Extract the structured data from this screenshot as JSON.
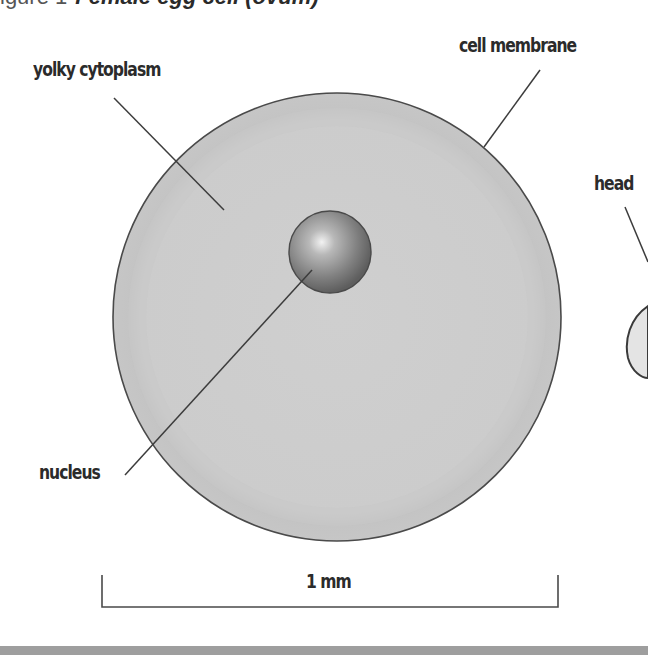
{
  "figure": {
    "title_prefix": "igure 1",
    "title": "Female egg cell (ovum)",
    "title_visible_note": "title partially cropped at top edge"
  },
  "labels": {
    "yolky_cytoplasm": "yolky cytoplasm",
    "cell_membrane": "cell membrane",
    "nucleus": "nucleus",
    "head": "head",
    "scale": "1 mm"
  },
  "colors": {
    "cytoplasm_fill": "#c9c9c9",
    "cytoplasm_inner": "#cdcdcd",
    "membrane_stroke": "#4a4a4a",
    "nucleus_dark": "#6e6e6e",
    "nucleus_light": "#e8e8e8",
    "line": "#3c3c3c",
    "label_text": "#2b2b2b",
    "sperm_head_fill": "#e4e4e4",
    "bottom_band": "#9e9e9e"
  }
}
